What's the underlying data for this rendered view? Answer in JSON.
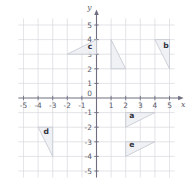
{
  "chart_data": {
    "type": "scatter",
    "title": "",
    "xlabel": "x",
    "ylabel": "y",
    "xlim": [
      -5.6,
      5.6
    ],
    "ylim": [
      -5.6,
      5.6
    ],
    "grid": true,
    "legend": "none",
    "x_ticks": [
      "-5",
      "-4",
      "-3",
      "-2",
      "-1",
      "0",
      "1",
      "2",
      "3",
      "4",
      "5"
    ],
    "x_tick_values": [
      -5,
      -4,
      -3,
      -2,
      -1,
      0,
      1,
      2,
      3,
      4,
      5
    ],
    "y_ticks": [
      "5",
      "4",
      "3",
      "2",
      "1",
      "0",
      "-1",
      "-2",
      "-3",
      "-4",
      "-5"
    ],
    "y_tick_values": [
      5,
      4,
      3,
      2,
      1,
      0,
      -1,
      -2,
      -3,
      -4,
      -5
    ],
    "shapes": [
      {
        "label": "c",
        "label_x": -0.45,
        "label_y": 3.35,
        "vertices": [
          [
            -2,
            3
          ],
          [
            0,
            3
          ],
          [
            0,
            4
          ]
        ]
      },
      {
        "label": "",
        "label_x": 1.55,
        "label_y": 4.0,
        "vertices": [
          [
            1,
            4
          ],
          [
            1,
            2
          ],
          [
            2,
            2
          ]
        ]
      },
      {
        "label": "b",
        "label_x": 4.75,
        "label_y": 3.45,
        "vertices": [
          [
            4,
            4
          ],
          [
            5,
            4
          ],
          [
            5,
            2
          ]
        ]
      },
      {
        "label": "a",
        "label_x": 2.42,
        "label_y": -1.35,
        "vertices": [
          [
            2,
            -1
          ],
          [
            4,
            -1
          ],
          [
            2,
            -2
          ]
        ]
      },
      {
        "label": "e",
        "label_x": 2.42,
        "label_y": -3.35,
        "vertices": [
          [
            2,
            -3
          ],
          [
            4,
            -3
          ],
          [
            2,
            -4
          ]
        ]
      },
      {
        "label": "d",
        "label_x": -3.45,
        "label_y": -2.45,
        "vertices": [
          [
            -4,
            -2
          ],
          [
            -3,
            -2
          ],
          [
            -3,
            -4
          ]
        ]
      }
    ],
    "colors": {
      "grid": "#d9d9e0",
      "axis": "#6e6e80",
      "shape_fill": "#eef0f3",
      "shape_stroke": "#c3c6cf",
      "label_text": "#33333d",
      "tick_text": "#5a5a68",
      "background": "#ffffff"
    }
  }
}
